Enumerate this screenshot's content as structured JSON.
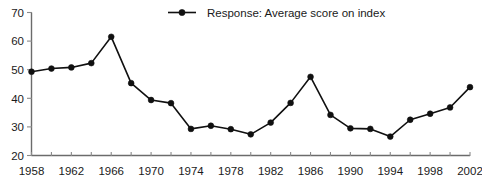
{
  "chart_data": {
    "type": "line",
    "title": "",
    "subtitle": "",
    "xlabel": "",
    "ylabel": "",
    "legend": {
      "position": "top-center",
      "entries": [
        {
          "name": "Response: Average score on index",
          "marker": "filled-circle",
          "color": "#101010"
        }
      ]
    },
    "grid": false,
    "xlim": [
      1958,
      2002
    ],
    "ylim": [
      20,
      70
    ],
    "yticks": [
      20,
      30,
      40,
      50,
      60,
      70
    ],
    "ytick_labels": [
      "20",
      "30",
      "40",
      "50",
      "60",
      "70"
    ],
    "xticks": [
      1958,
      1960,
      1962,
      1964,
      1966,
      1968,
      1970,
      1972,
      1974,
      1976,
      1978,
      1980,
      1982,
      1984,
      1986,
      1988,
      1990,
      1992,
      1994,
      1996,
      1998,
      2000,
      2002
    ],
    "xtick_labels_shown": [
      "1958",
      "1962",
      "1966",
      "1970",
      "1974",
      "1978",
      "1982",
      "1986",
      "1990",
      "1994",
      "1998",
      "2002"
    ],
    "xtick_label_years": [
      1958,
      1962,
      1966,
      1970,
      1974,
      1978,
      1982,
      1986,
      1990,
      1994,
      1998,
      2002
    ],
    "x": [
      1958,
      1960,
      1962,
      1964,
      1966,
      1968,
      1970,
      1972,
      1974,
      1976,
      1978,
      1980,
      1982,
      1984,
      1986,
      1988,
      1990,
      1992,
      1994,
      1996,
      1998,
      2000,
      2002
    ],
    "series": [
      {
        "name": "Response: Average score on index",
        "color": "#101010",
        "values": [
          49.3,
          50.4,
          50.8,
          52.3,
          61.5,
          45.3,
          39.4,
          38.3,
          29.3,
          30.4,
          29.2,
          27.4,
          31.5,
          38.4,
          47.5,
          34.2,
          29.5,
          29.3,
          26.6,
          32.5,
          34.6,
          36.8,
          43.9
        ]
      }
    ],
    "annotations": []
  }
}
